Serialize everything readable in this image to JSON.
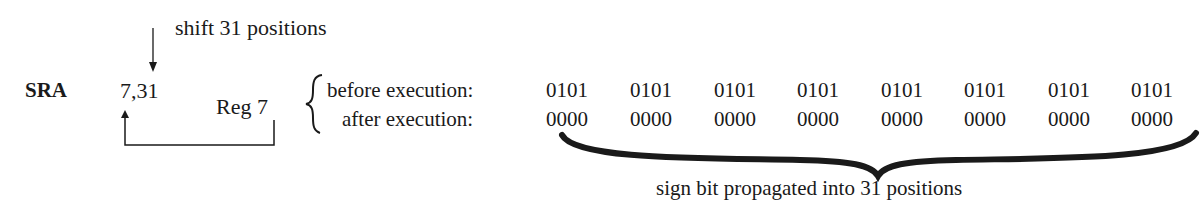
{
  "diagram": {
    "mnemonic": "SRA",
    "operands": "7,31",
    "shift_annotation": "shift 31 positions",
    "register_label": "Reg 7",
    "before_label": "before execution:",
    "after_label": "after execution:",
    "before_bits": [
      "0101",
      "0101",
      "0101",
      "0101",
      "0101",
      "0101",
      "0101",
      "0101"
    ],
    "after_bits": [
      "0000",
      "0000",
      "0000",
      "0000",
      "0000",
      "0000",
      "0000",
      "0000"
    ],
    "brace_caption": "sign bit propagated into 31 positions"
  }
}
